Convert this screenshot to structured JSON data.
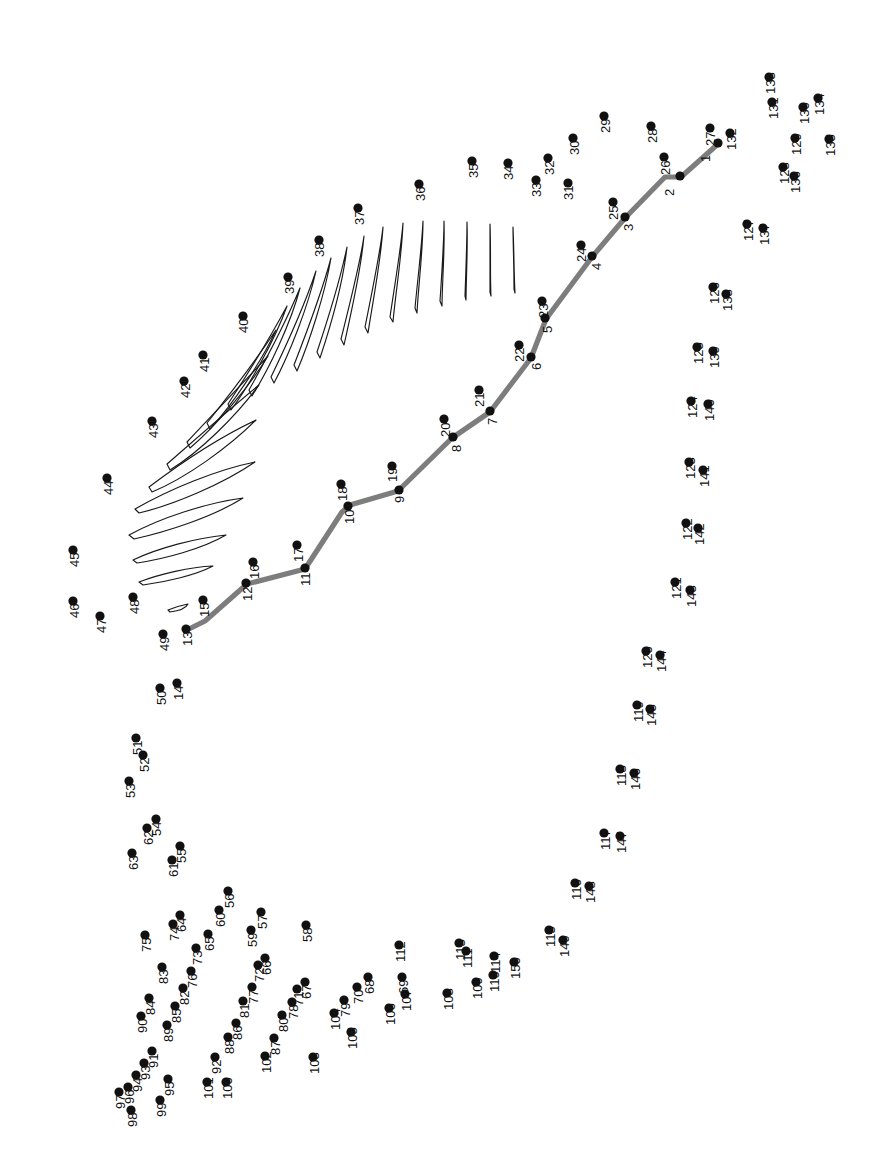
{
  "page": {
    "width": 880,
    "height": 1175,
    "background_color": "#ffffff",
    "dot_color": "#111111",
    "label_color": "#111111",
    "rachis_color": "#7d7d7d",
    "barb_color": "#1a1a1a",
    "label_rotation_deg": -90,
    "total_dots": 150
  },
  "dots": [
    {
      "n": "1",
      "x": 718,
      "y": 143,
      "lx": 710,
      "ly": 162
    },
    {
      "n": "2",
      "x": 680,
      "y": 176,
      "lx": 674,
      "ly": 196
    },
    {
      "n": "3",
      "x": 625,
      "y": 217,
      "lx": 633,
      "ly": 231
    },
    {
      "n": "4",
      "x": 592,
      "y": 256,
      "lx": 601,
      "ly": 270
    },
    {
      "n": "5",
      "x": 545,
      "y": 318,
      "lx": 552,
      "ly": 333
    },
    {
      "n": "6",
      "x": 531,
      "y": 357,
      "lx": 541,
      "ly": 370
    },
    {
      "n": "7",
      "x": 490,
      "y": 411,
      "lx": 497,
      "ly": 425
    },
    {
      "n": "8",
      "x": 453,
      "y": 437,
      "lx": 461,
      "ly": 452
    },
    {
      "n": "9",
      "x": 399,
      "y": 490,
      "lx": 404,
      "ly": 503
    },
    {
      "n": "10",
      "x": 348,
      "y": 506,
      "lx": 354,
      "ly": 524
    },
    {
      "n": "11",
      "x": 305,
      "y": 568,
      "lx": 310,
      "ly": 586
    },
    {
      "n": "12",
      "x": 246,
      "y": 583,
      "lx": 252,
      "ly": 601
    },
    {
      "n": "13",
      "x": 186,
      "y": 629,
      "lx": 192,
      "ly": 646
    },
    {
      "n": "14",
      "x": 177,
      "y": 683,
      "lx": 183,
      "ly": 700
    },
    {
      "n": "15",
      "x": 203,
      "y": 600,
      "lx": 209,
      "ly": 617
    },
    {
      "n": "16",
      "x": 253,
      "y": 562,
      "lx": 259,
      "ly": 579
    },
    {
      "n": "17",
      "x": 297,
      "y": 545,
      "lx": 303,
      "ly": 562
    },
    {
      "n": "18",
      "x": 341,
      "y": 484,
      "lx": 347,
      "ly": 501
    },
    {
      "n": "19",
      "x": 392,
      "y": 466,
      "lx": 397,
      "ly": 482
    },
    {
      "n": "20",
      "x": 444,
      "y": 419,
      "lx": 450,
      "ly": 437
    },
    {
      "n": "21",
      "x": 479,
      "y": 390,
      "lx": 484,
      "ly": 407
    },
    {
      "n": "22",
      "x": 519,
      "y": 345,
      "lx": 524,
      "ly": 362
    },
    {
      "n": "23",
      "x": 542,
      "y": 301,
      "lx": 548,
      "ly": 318
    },
    {
      "n": "24",
      "x": 581,
      "y": 245,
      "lx": 586,
      "ly": 262
    },
    {
      "n": "25",
      "x": 613,
      "y": 202,
      "lx": 618,
      "ly": 220
    },
    {
      "n": "26",
      "x": 664,
      "y": 157,
      "lx": 670,
      "ly": 175
    },
    {
      "n": "27",
      "x": 710,
      "y": 128,
      "lx": 715,
      "ly": 146
    },
    {
      "n": "28",
      "x": 651,
      "y": 126,
      "lx": 657,
      "ly": 143
    },
    {
      "n": "29",
      "x": 604,
      "y": 116,
      "lx": 610,
      "ly": 133
    },
    {
      "n": "30",
      "x": 573,
      "y": 138,
      "lx": 579,
      "ly": 155
    },
    {
      "n": "31",
      "x": 568,
      "y": 183,
      "lx": 573,
      "ly": 200
    },
    {
      "n": "32",
      "x": 548,
      "y": 158,
      "lx": 554,
      "ly": 175
    },
    {
      "n": "33",
      "x": 536,
      "y": 180,
      "lx": 541,
      "ly": 197
    },
    {
      "n": "34",
      "x": 508,
      "y": 163,
      "lx": 513,
      "ly": 180
    },
    {
      "n": "35",
      "x": 472,
      "y": 161,
      "lx": 478,
      "ly": 178
    },
    {
      "n": "36",
      "x": 419,
      "y": 184,
      "lx": 425,
      "ly": 201
    },
    {
      "n": "37",
      "x": 358,
      "y": 208,
      "lx": 364,
      "ly": 225
    },
    {
      "n": "38",
      "x": 319,
      "y": 240,
      "lx": 324,
      "ly": 257
    },
    {
      "n": "39",
      "x": 288,
      "y": 277,
      "lx": 294,
      "ly": 294
    },
    {
      "n": "40",
      "x": 243,
      "y": 316,
      "lx": 248,
      "ly": 333
    },
    {
      "n": "41",
      "x": 203,
      "y": 355,
      "lx": 209,
      "ly": 372
    },
    {
      "n": "42",
      "x": 184,
      "y": 381,
      "lx": 190,
      "ly": 398
    },
    {
      "n": "43",
      "x": 152,
      "y": 421,
      "lx": 158,
      "ly": 438
    },
    {
      "n": "44",
      "x": 107,
      "y": 478,
      "lx": 113,
      "ly": 495
    },
    {
      "n": "45",
      "x": 73,
      "y": 550,
      "lx": 79,
      "ly": 567
    },
    {
      "n": "46",
      "x": 73,
      "y": 601,
      "lx": 79,
      "ly": 618
    },
    {
      "n": "47",
      "x": 100,
      "y": 616,
      "lx": 106,
      "ly": 633
    },
    {
      "n": "48",
      "x": 133,
      "y": 597,
      "lx": 139,
      "ly": 614
    },
    {
      "n": "49",
      "x": 163,
      "y": 634,
      "lx": 169,
      "ly": 651
    },
    {
      "n": "50",
      "x": 160,
      "y": 688,
      "lx": 166,
      "ly": 705
    },
    {
      "n": "51",
      "x": 136,
      "y": 738,
      "lx": 142,
      "ly": 755
    },
    {
      "n": "52",
      "x": 143,
      "y": 755,
      "lx": 149,
      "ly": 772
    },
    {
      "n": "53",
      "x": 129,
      "y": 781,
      "lx": 135,
      "ly": 798
    },
    {
      "n": "54",
      "x": 156,
      "y": 819,
      "lx": 161,
      "ly": 836
    },
    {
      "n": "55",
      "x": 180,
      "y": 846,
      "lx": 186,
      "ly": 863
    },
    {
      "n": "56",
      "x": 228,
      "y": 891,
      "lx": 234,
      "ly": 908
    },
    {
      "n": "57",
      "x": 261,
      "y": 912,
      "lx": 267,
      "ly": 929
    },
    {
      "n": "58",
      "x": 306,
      "y": 925,
      "lx": 312,
      "ly": 942
    },
    {
      "n": "59",
      "x": 251,
      "y": 930,
      "lx": 257,
      "ly": 947
    },
    {
      "n": "60",
      "x": 219,
      "y": 910,
      "lx": 225,
      "ly": 927
    },
    {
      "n": "61",
      "x": 172,
      "y": 860,
      "lx": 178,
      "ly": 877
    },
    {
      "n": "62",
      "x": 147,
      "y": 828,
      "lx": 153,
      "ly": 845
    },
    {
      "n": "63",
      "x": 132,
      "y": 853,
      "lx": 138,
      "ly": 870
    },
    {
      "n": "64",
      "x": 180,
      "y": 915,
      "lx": 186,
      "ly": 932
    },
    {
      "n": "65",
      "x": 208,
      "y": 934,
      "lx": 214,
      "ly": 951
    },
    {
      "n": "66",
      "x": 265,
      "y": 958,
      "lx": 271,
      "ly": 975
    },
    {
      "n": "67",
      "x": 305,
      "y": 982,
      "lx": 311,
      "ly": 999
    },
    {
      "n": "68",
      "x": 368,
      "y": 977,
      "lx": 374,
      "ly": 994
    },
    {
      "n": "69",
      "x": 402,
      "y": 977,
      "lx": 408,
      "ly": 994
    },
    {
      "n": "70",
      "x": 357,
      "y": 987,
      "lx": 363,
      "ly": 1004
    },
    {
      "n": "71",
      "x": 297,
      "y": 989,
      "lx": 303,
      "ly": 1006
    },
    {
      "n": "72",
      "x": 258,
      "y": 965,
      "lx": 264,
      "ly": 982
    },
    {
      "n": "73",
      "x": 196,
      "y": 948,
      "lx": 202,
      "ly": 965
    },
    {
      "n": "74",
      "x": 173,
      "y": 924,
      "lx": 179,
      "ly": 941
    },
    {
      "n": "75",
      "x": 145,
      "y": 935,
      "lx": 151,
      "ly": 952
    },
    {
      "n": "76",
      "x": 191,
      "y": 971,
      "lx": 197,
      "ly": 988
    },
    {
      "n": "77",
      "x": 252,
      "y": 987,
      "lx": 258,
      "ly": 1004
    },
    {
      "n": "78",
      "x": 292,
      "y": 1002,
      "lx": 298,
      "ly": 1019
    },
    {
      "n": "79",
      "x": 344,
      "y": 1000,
      "lx": 350,
      "ly": 1017
    },
    {
      "n": "80",
      "x": 282,
      "y": 1015,
      "lx": 288,
      "ly": 1032
    },
    {
      "n": "81",
      "x": 243,
      "y": 1001,
      "lx": 249,
      "ly": 1018
    },
    {
      "n": "82",
      "x": 183,
      "y": 988,
      "lx": 189,
      "ly": 1005
    },
    {
      "n": "83",
      "x": 162,
      "y": 967,
      "lx": 168,
      "ly": 984
    },
    {
      "n": "84",
      "x": 149,
      "y": 998,
      "lx": 155,
      "ly": 1015
    },
    {
      "n": "85",
      "x": 175,
      "y": 1006,
      "lx": 181,
      "ly": 1023
    },
    {
      "n": "86",
      "x": 236,
      "y": 1023,
      "lx": 242,
      "ly": 1040
    },
    {
      "n": "87",
      "x": 274,
      "y": 1038,
      "lx": 280,
      "ly": 1055
    },
    {
      "n": "88",
      "x": 228,
      "y": 1037,
      "lx": 234,
      "ly": 1054
    },
    {
      "n": "89",
      "x": 167,
      "y": 1025,
      "lx": 173,
      "ly": 1042
    },
    {
      "n": "90",
      "x": 141,
      "y": 1016,
      "lx": 147,
      "ly": 1033
    },
    {
      "n": "91",
      "x": 152,
      "y": 1051,
      "lx": 158,
      "ly": 1068
    },
    {
      "n": "92",
      "x": 215,
      "y": 1057,
      "lx": 221,
      "ly": 1074
    },
    {
      "n": "93",
      "x": 144,
      "y": 1063,
      "lx": 150,
      "ly": 1080
    },
    {
      "n": "94",
      "x": 136,
      "y": 1075,
      "lx": 142,
      "ly": 1092
    },
    {
      "n": "95",
      "x": 168,
      "y": 1079,
      "lx": 174,
      "ly": 1096
    },
    {
      "n": "96",
      "x": 128,
      "y": 1087,
      "lx": 134,
      "ly": 1104
    },
    {
      "n": "97",
      "x": 119,
      "y": 1092,
      "lx": 125,
      "ly": 1109
    },
    {
      "n": "98",
      "x": 131,
      "y": 1110,
      "lx": 137,
      "ly": 1127
    },
    {
      "n": "99",
      "x": 160,
      "y": 1100,
      "lx": 166,
      "ly": 1117
    },
    {
      "n": "100",
      "x": 226,
      "y": 1082,
      "lx": 232,
      "ly": 1099
    },
    {
      "n": "101",
      "x": 207,
      "y": 1082,
      "lx": 213,
      "ly": 1099
    },
    {
      "n": "102",
      "x": 265,
      "y": 1056,
      "lx": 271,
      "ly": 1073
    },
    {
      "n": "103",
      "x": 313,
      "y": 1057,
      "lx": 319,
      "ly": 1074
    },
    {
      "n": "104",
      "x": 334,
      "y": 1013,
      "lx": 340,
      "ly": 1030
    },
    {
      "n": "105",
      "x": 351,
      "y": 1032,
      "lx": 357,
      "ly": 1049
    },
    {
      "n": "106",
      "x": 389,
      "y": 1008,
      "lx": 395,
      "ly": 1025
    },
    {
      "n": "107",
      "x": 405,
      "y": 994,
      "lx": 411,
      "ly": 1011
    },
    {
      "n": "108",
      "x": 447,
      "y": 993,
      "lx": 453,
      "ly": 1010
    },
    {
      "n": "109",
      "x": 476,
      "y": 982,
      "lx": 482,
      "ly": 999
    },
    {
      "n": "110",
      "x": 493,
      "y": 975,
      "lx": 499,
      "ly": 992
    },
    {
      "n": "111",
      "x": 466,
      "y": 951,
      "lx": 472,
      "ly": 968
    },
    {
      "n": "112",
      "x": 399,
      "y": 945,
      "lx": 405,
      "ly": 962
    },
    {
      "n": "113",
      "x": 459,
      "y": 943,
      "lx": 465,
      "ly": 960
    },
    {
      "n": "114",
      "x": 494,
      "y": 956,
      "lx": 500,
      "ly": 973
    },
    {
      "n": "115",
      "x": 549,
      "y": 930,
      "lx": 555,
      "ly": 947
    },
    {
      "n": "116",
      "x": 575,
      "y": 883,
      "lx": 581,
      "ly": 900
    },
    {
      "n": "117",
      "x": 604,
      "y": 833,
      "lx": 610,
      "ly": 850
    },
    {
      "n": "118",
      "x": 620,
      "y": 769,
      "lx": 626,
      "ly": 786
    },
    {
      "n": "119",
      "x": 637,
      "y": 705,
      "lx": 643,
      "ly": 722
    },
    {
      "n": "120",
      "x": 646,
      "y": 651,
      "lx": 652,
      "ly": 668
    },
    {
      "n": "121",
      "x": 675,
      "y": 582,
      "lx": 681,
      "ly": 599
    },
    {
      "n": "122",
      "x": 686,
      "y": 523,
      "lx": 692,
      "ly": 540
    },
    {
      "n": "123",
      "x": 689,
      "y": 462,
      "lx": 695,
      "ly": 479
    },
    {
      "n": "124",
      "x": 691,
      "y": 401,
      "lx": 697,
      "ly": 418
    },
    {
      "n": "125",
      "x": 697,
      "y": 347,
      "lx": 703,
      "ly": 364
    },
    {
      "n": "126",
      "x": 713,
      "y": 287,
      "lx": 719,
      "ly": 304
    },
    {
      "n": "127",
      "x": 747,
      "y": 224,
      "lx": 753,
      "ly": 241
    },
    {
      "n": "128",
      "x": 783,
      "y": 167,
      "lx": 789,
      "ly": 184
    },
    {
      "n": "129",
      "x": 795,
      "y": 138,
      "lx": 801,
      "ly": 155
    },
    {
      "n": "130",
      "x": 803,
      "y": 107,
      "lx": 809,
      "ly": 124
    },
    {
      "n": "131",
      "x": 772,
      "y": 102,
      "lx": 778,
      "ly": 119
    },
    {
      "n": "132",
      "x": 730,
      "y": 133,
      "lx": 736,
      "ly": 150
    },
    {
      "n": "133",
      "x": 769,
      "y": 77,
      "lx": 775,
      "ly": 94
    },
    {
      "n": "134",
      "x": 818,
      "y": 98,
      "lx": 824,
      "ly": 115
    },
    {
      "n": "135",
      "x": 829,
      "y": 139,
      "lx": 835,
      "ly": 156
    },
    {
      "n": "136",
      "x": 794,
      "y": 176,
      "lx": 800,
      "ly": 193
    },
    {
      "n": "137",
      "x": 763,
      "y": 228,
      "lx": 769,
      "ly": 245
    },
    {
      "n": "138",
      "x": 726,
      "y": 294,
      "lx": 732,
      "ly": 311
    },
    {
      "n": "139",
      "x": 713,
      "y": 351,
      "lx": 719,
      "ly": 368
    },
    {
      "n": "140",
      "x": 708,
      "y": 404,
      "lx": 714,
      "ly": 421
    },
    {
      "n": "141",
      "x": 703,
      "y": 470,
      "lx": 709,
      "ly": 487
    },
    {
      "n": "142",
      "x": 698,
      "y": 528,
      "lx": 704,
      "ly": 545
    },
    {
      "n": "143",
      "x": 690,
      "y": 590,
      "lx": 696,
      "ly": 607
    },
    {
      "n": "144",
      "x": 660,
      "y": 655,
      "lx": 666,
      "ly": 672
    },
    {
      "n": "145",
      "x": 650,
      "y": 709,
      "lx": 656,
      "ly": 726
    },
    {
      "n": "146",
      "x": 634,
      "y": 773,
      "lx": 640,
      "ly": 790
    },
    {
      "n": "147",
      "x": 620,
      "y": 836,
      "lx": 626,
      "ly": 853
    },
    {
      "n": "148",
      "x": 589,
      "y": 886,
      "lx": 595,
      "ly": 903
    },
    {
      "n": "149",
      "x": 563,
      "y": 940,
      "lx": 569,
      "ly": 957
    },
    {
      "n": "150",
      "x": 514,
      "y": 962,
      "lx": 520,
      "ly": 979
    }
  ],
  "artwork": {
    "rachis_path": "M 187,630 L 205,621 L 247,584 L 305,569 L 342,512 L 350,505 L 398,491 L 452,438 L 490,412 L 531,358 L 546,319 L 592,257 L 625,218 L 665,177 L 681,177 L 718,144",
    "barbs": [
      "M 168,610 C 175,607 183,605 188,604 C 186,608 178,611 170,612 Z",
      "M 139,582 C 160,574 190,567 213,566 C 196,575 166,582 143,585 Z",
      "M 133,560 C 158,548 196,538 226,535 C 202,549 164,559 137,563 Z",
      "M 129,535 C 160,518 206,503 243,498 C 213,517 166,532 134,539 Z",
      "M 135,509 C 170,489 216,470 255,462 C 223,484 173,505 139,513 Z",
      "M 149,487 C 182,462 222,436 256,420 C 229,447 186,478 152,492 Z",
      "M 167,464 C 198,437 232,407 259,385 C 237,415 200,452 170,470 Z",
      "M 187,442 C 214,413 245,381 268,356 C 249,387 216,426 190,448 Z",
      "M 207,423 C 231,393 258,357 276,330 C 261,363 232,405 210,429 Z",
      "M 228,404 C 249,372 272,334 287,306 C 275,340 250,384 231,410 Z",
      "M 249,390 C 268,356 288,317 300,288 C 291,323 269,369 252,396 Z",
      "M 271,377 C 288,342 306,301 316,271 C 308,307 289,355 274,383 Z",
      "M 294,365 C 308,329 323,288 331,258 C 325,294 309,343 297,371 Z",
      "M 317,352 C 329,316 341,276 347,247 C 343,283 329,331 320,358 Z",
      "M 341,339 C 350,303 360,264 364,236 C 361,271 350,318 344,345 Z",
      "M 365,327 C 372,292 380,254 383,227 C 381,261 372,306 368,333 Z",
      "M 390,317 C 395,283 401,248 403,223 C 402,255 395,297 393,322 Z",
      "M 415,308 C 418,276 422,244 423,221 C 423,251 418,290 417,313 Z",
      "M 440,301 C 442,271 444,242 444,221 C 445,249 442,285 442,306 Z",
      "M 465,296 C 466,268 467,241 467,222 C 468,248 466,281 466,300 Z",
      "M 490,292 C 490,266 490,241 490,224 C 491,248 490,278 491,296 Z",
      "M 514,289 C 514,265 513,242 513,227 C 514,249 514,276 515,293 Z"
    ]
  }
}
